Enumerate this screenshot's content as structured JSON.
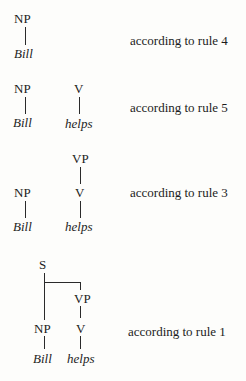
{
  "derivations": [
    {
      "step": 1,
      "nodes": {
        "np": "NP",
        "np_leaf": "Bill"
      },
      "rule_label": "according to rule 4"
    },
    {
      "step": 2,
      "nodes": {
        "np": "NP",
        "np_leaf": "Bill",
        "v": "V",
        "v_leaf": "helps"
      },
      "rule_label": "according to rule 5"
    },
    {
      "step": 3,
      "nodes": {
        "vp": "VP",
        "np": "NP",
        "np_leaf": "Bill",
        "v": "V",
        "v_leaf": "helps"
      },
      "rule_label": "according to rule 3"
    },
    {
      "step": 4,
      "nodes": {
        "s": "S",
        "vp": "VP",
        "np": "NP",
        "np_leaf": "Bill",
        "v": "V",
        "v_leaf": "helps"
      },
      "rule_label": "according to rule 1"
    }
  ]
}
